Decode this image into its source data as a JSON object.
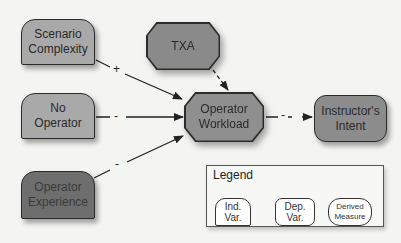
{
  "diagram": {
    "nodes": {
      "scenario_complexity": {
        "label_line1": "Scenario",
        "label_line2": "Complexity",
        "type": "Ind. Var.",
        "fill": "#a9a9a9"
      },
      "no_operator": {
        "label_line1": "No",
        "label_line2": "Operator",
        "type": "Ind. Var.",
        "fill": "#a9a9a9"
      },
      "operator_experience": {
        "label_line1": "Operator",
        "label_line2": "Experience",
        "type": "Ind. Var.",
        "fill": "#6e6e6e"
      },
      "txa": {
        "label": "TXA",
        "type": "Dep. Var.",
        "fill": "#8a8a8a"
      },
      "operator_workload": {
        "label_line1": "Operator",
        "label_line2": "Workload",
        "type": "Dep. Var.",
        "fill": "#8f8f8f"
      },
      "instructors_intent": {
        "label_line1": "Instructor's",
        "label_line2": "Intent",
        "type": "Derived Measure",
        "fill": "#8c8c8c"
      }
    },
    "edges": [
      {
        "from": "Scenario Complexity",
        "to": "Operator Workload",
        "sign": "+",
        "style": "solid"
      },
      {
        "from": "No Operator",
        "to": "Operator Workload",
        "sign": "-",
        "style": "solid"
      },
      {
        "from": "Operator Experience",
        "to": "Operator Workload",
        "sign": "-",
        "style": "solid"
      },
      {
        "from": "TXA",
        "to": "Operator Workload",
        "sign": "",
        "style": "dashed"
      },
      {
        "from": "Operator Workload",
        "to": "Instructor's Intent",
        "sign": "-",
        "style": "dashed"
      }
    ],
    "signs": {
      "scenario": "+",
      "no_operator": "-",
      "experience": "-",
      "workload_intent": "-"
    }
  },
  "legend": {
    "title": "Legend",
    "items": [
      {
        "line1": "Ind.",
        "line2": "Var."
      },
      {
        "line1": "Dep.",
        "line2": "Var."
      },
      {
        "line1": "Derived",
        "line2": "Measure"
      }
    ]
  }
}
